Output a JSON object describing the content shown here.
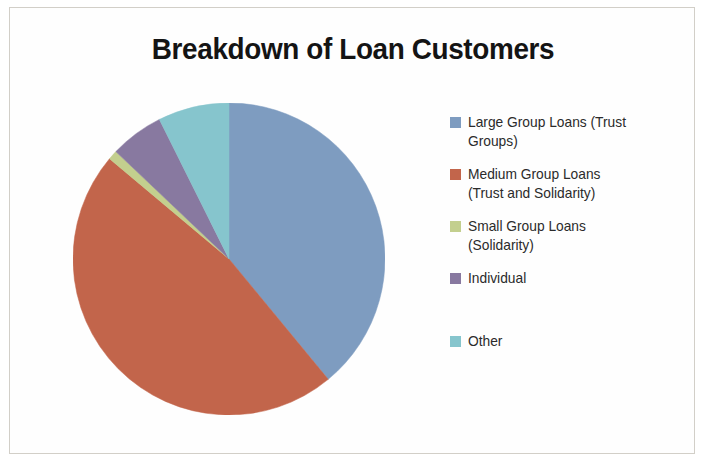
{
  "chart_data": {
    "type": "pie",
    "title": "Breakdown of Loan Customers",
    "xlabel": "",
    "ylabel": "",
    "legend_position": "right",
    "grid": false,
    "start_angle_deg": 0,
    "direction": "clockwise",
    "categories": [
      "Large Group Loans (Trust Groups)",
      "Medium Group Loans (Trust and Solidarity)",
      "Small Group Loans (Solidarity)",
      "Individual",
      "Other"
    ],
    "values": [
      39,
      47,
      1,
      5.5,
      7.5
    ],
    "value_unit": "percent",
    "colors": [
      "#7e9cc0",
      "#c2654b",
      "#c3cf8e",
      "#8879a0",
      "#86c5cd"
    ],
    "slices": [
      {
        "label": "Large Group Loans (Trust Groups)",
        "value": 39,
        "color": "#7e9cc0",
        "start_deg": 0,
        "end_deg": 140.5
      },
      {
        "label": "Medium Group Loans (Trust and Solidarity)",
        "value": 47,
        "color": "#c2654b",
        "start_deg": 140.5,
        "end_deg": 310
      },
      {
        "label": "Small Group Loans (Solidarity)",
        "value": 1,
        "color": "#c3cf8e",
        "start_deg": 310,
        "end_deg": 313.5
      },
      {
        "label": "Individual",
        "value": 5.5,
        "color": "#8879a0",
        "start_deg": 313.5,
        "end_deg": 333.5
      },
      {
        "label": "Other",
        "value": 7.5,
        "color": "#86c5cd",
        "start_deg": 333.5,
        "end_deg": 360
      }
    ]
  },
  "title": {
    "text": "Breakdown of Loan Customers"
  },
  "legend": {
    "items": [
      {
        "label": "Large Group Loans (Trust\nGroups)",
        "color": "#7e9cc0",
        "swatch_name": "legend-swatch-large-group-loans"
      },
      {
        "label": "Medium Group Loans\n(Trust and Solidarity)",
        "color": "#c2654b",
        "swatch_name": "legend-swatch-medium-group-loans"
      },
      {
        "label": "Small Group Loans\n(Solidarity)",
        "color": "#c3cf8e",
        "swatch_name": "legend-swatch-small-group-loans"
      },
      {
        "label": "Individual",
        "color": "#8879a0",
        "swatch_name": "legend-swatch-individual"
      },
      {
        "label": "Other",
        "color": "#86c5cd",
        "swatch_name": "legend-swatch-other"
      }
    ]
  },
  "colors": {
    "background": "#ffffff",
    "title_text": "#141414",
    "legend_text": "#2b2b2b",
    "frame_border": "#d2cfc8"
  }
}
